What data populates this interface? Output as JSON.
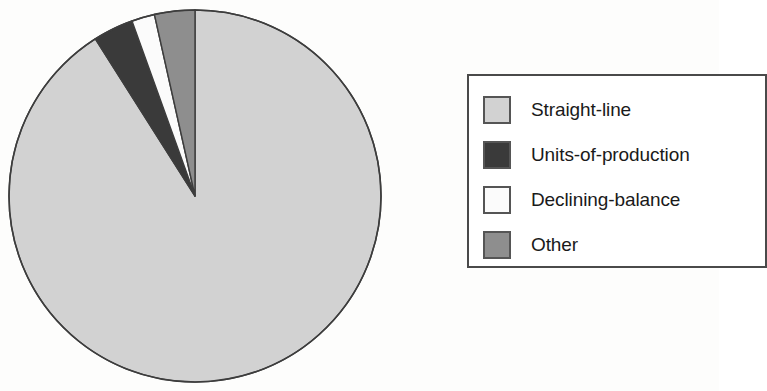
{
  "chart_data": {
    "type": "pie",
    "title": "",
    "subtitle": "",
    "xlabel": "",
    "ylabel": "",
    "grid": false,
    "legend_position": "right",
    "start_angle_deg": 90,
    "direction": "clockwise",
    "categories": [
      "Straight-line",
      "Units-of-production",
      "Declining-balance",
      "Other"
    ],
    "values": [
      91,
      3.5,
      2,
      3.5
    ],
    "units": "percent",
    "colors": [
      "#d2d2d2",
      "#3a3a3a",
      "#fbfbfb",
      "#8e8e8e"
    ],
    "slices": [
      {
        "label": "Straight-line",
        "value": 91,
        "color": "#d2d2d2"
      },
      {
        "label": "Units-of-production",
        "value": 3.5,
        "color": "#3a3a3a"
      },
      {
        "label": "Declining-balance",
        "value": 2,
        "color": "#fbfbfb"
      },
      {
        "label": "Other",
        "value": 3.5,
        "color": "#8e8e8e"
      }
    ]
  },
  "pie": {
    "center_x": 195,
    "center_y": 196,
    "radius": 186,
    "outline_color": "#3d3d3d",
    "slice_straight_line": "Straight-line",
    "slice_units_of_production": "Units-of-production",
    "slice_declining_balance": "Declining-balance",
    "slice_other": "Other"
  },
  "legend": {
    "items": [
      {
        "label": "Straight-line",
        "color": "#d2d2d2"
      },
      {
        "label": "Units-of-production",
        "color": "#3a3a3a"
      },
      {
        "label": "Declining-balance",
        "color": "#fbfbfb"
      },
      {
        "label": "Other",
        "color": "#8e8e8e"
      }
    ]
  }
}
